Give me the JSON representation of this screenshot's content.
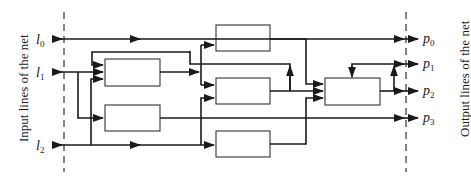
{
  "diagram": {
    "left_side_label": "Input lines of the net",
    "right_side_label": "Output lines of the net",
    "inputs": [
      {
        "name": "l",
        "sub": "0"
      },
      {
        "name": "l",
        "sub": "1"
      },
      {
        "name": "l",
        "sub": "2"
      }
    ],
    "outputs": [
      {
        "name": "p",
        "sub": "0"
      },
      {
        "name": "p",
        "sub": "1"
      },
      {
        "name": "p",
        "sub": "2"
      },
      {
        "name": "p",
        "sub": "3"
      }
    ],
    "blocks": [
      "block-a",
      "block-b",
      "block-c",
      "block-d",
      "block-e",
      "block-f"
    ]
  }
}
